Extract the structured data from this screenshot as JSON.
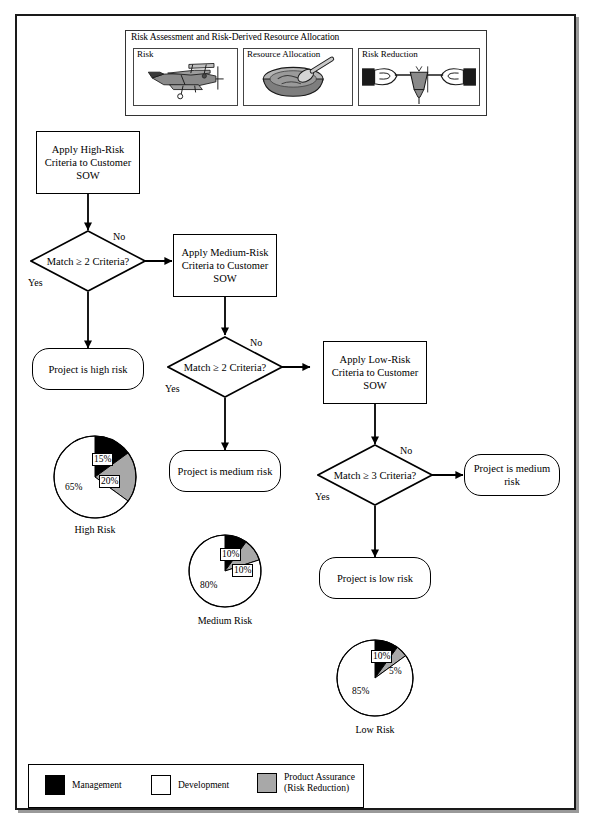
{
  "header": {
    "title": "Risk Assessment and Risk-Derived Resource Allocation",
    "panels": [
      {
        "label": "Risk",
        "icon": "airplane-icon"
      },
      {
        "label": "Resource Allocation",
        "icon": "bowl-and-spoon-icon"
      },
      {
        "label": "Risk Reduction",
        "icon": "hands-pulling-rope-icon"
      }
    ]
  },
  "flow": {
    "high": {
      "process": "Apply High-Risk Criteria to Customer SOW",
      "decision": "Match ≥ 2 Criteria?",
      "yes_label": "Yes",
      "no_label": "No",
      "result": "Project is high risk"
    },
    "medium": {
      "process": "Apply Medium-Risk Criteria to Customer SOW",
      "decision": "Match ≥ 2 Criteria?",
      "yes_label": "Yes",
      "no_label": "No",
      "result": "Project is medium risk"
    },
    "low": {
      "process": "Apply Low-Risk Criteria to Customer SOW",
      "decision": "Match ≥ 3 Criteria?",
      "yes_label": "Yes",
      "no_label": "No",
      "result": "Project is low risk",
      "no_result": "Project is medium risk"
    }
  },
  "legend": {
    "items": [
      {
        "label": "Management",
        "color": "#000000"
      },
      {
        "label": "Development",
        "color": "#ffffff"
      },
      {
        "label": "Product Assurance\n(Risk Reduction)",
        "color": "#a8a8a8"
      }
    ]
  },
  "chart_data": [
    {
      "type": "pie",
      "title": "High Risk",
      "categories": [
        "Management",
        "Product Assurance (Risk Reduction)",
        "Development"
      ],
      "values": [
        15,
        20,
        65
      ],
      "labels": [
        "15%",
        "20%",
        "65%"
      ],
      "colors": [
        "#000000",
        "#a8a8a8",
        "#ffffff"
      ],
      "start_angle": 0,
      "direction": "clockwise",
      "units": "percent"
    },
    {
      "type": "pie",
      "title": "Medium Risk",
      "categories": [
        "Management",
        "Product Assurance (Risk Reduction)",
        "Development"
      ],
      "values": [
        10,
        10,
        80
      ],
      "labels": [
        "10%",
        "10%",
        "80%"
      ],
      "colors": [
        "#000000",
        "#a8a8a8",
        "#ffffff"
      ],
      "start_angle": 0,
      "direction": "clockwise",
      "units": "percent"
    },
    {
      "type": "pie",
      "title": "Low Risk",
      "categories": [
        "Management",
        "Product Assurance (Risk Reduction)",
        "Development"
      ],
      "values": [
        10,
        5,
        85
      ],
      "labels": [
        "10%",
        "5%",
        "85%"
      ],
      "colors": [
        "#000000",
        "#a8a8a8",
        "#ffffff"
      ],
      "start_angle": 0,
      "direction": "clockwise",
      "units": "percent"
    }
  ]
}
